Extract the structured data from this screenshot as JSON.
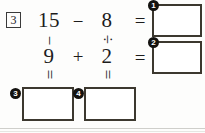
{
  "worksheet": {
    "question_number": "3",
    "grid": {
      "top_left_operand": "15",
      "top_operator": "−",
      "top_right_operand": "8",
      "left_vertical_operator": "−",
      "right_vertical_operator": "÷",
      "bottom_left_operand": "9",
      "bottom_operator": "+",
      "bottom_right_operand": "2",
      "left_vertical_equals": "=",
      "right_vertical_equals": "="
    },
    "row_equals": {
      "row1": "=",
      "row2": "="
    },
    "answers": [
      {
        "badge": "1",
        "value": "",
        "position": "right-top"
      },
      {
        "badge": "2",
        "value": "",
        "position": "right-bottom"
      },
      {
        "badge": "3",
        "value": "",
        "position": "bottom-left"
      },
      {
        "badge": "4",
        "value": "",
        "position": "bottom-right"
      }
    ],
    "colors": {
      "ink": "#1c1c1c",
      "box_border": "#3c382f",
      "badge_fill": "#14120f",
      "badge_text": "#ffffff",
      "page_background": "#fdfdfc",
      "rule": "#cfcfcb"
    }
  }
}
